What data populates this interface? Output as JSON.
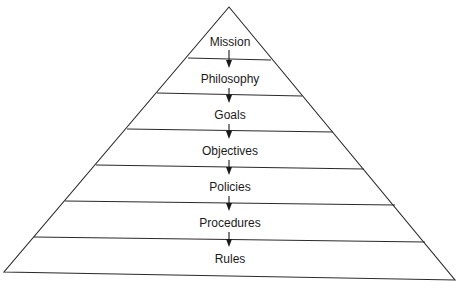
{
  "diagram": {
    "type": "pyramid",
    "levels": [
      {
        "label": "Mission"
      },
      {
        "label": "Philosophy"
      },
      {
        "label": "Goals"
      },
      {
        "label": "Objectives"
      },
      {
        "label": "Policies"
      },
      {
        "label": "Procedures"
      },
      {
        "label": "Rules"
      }
    ],
    "arrow_direction": "down",
    "colors": {
      "line": "#2a2a2a",
      "text": "#1a1a1a",
      "background": "#ffffff"
    }
  }
}
